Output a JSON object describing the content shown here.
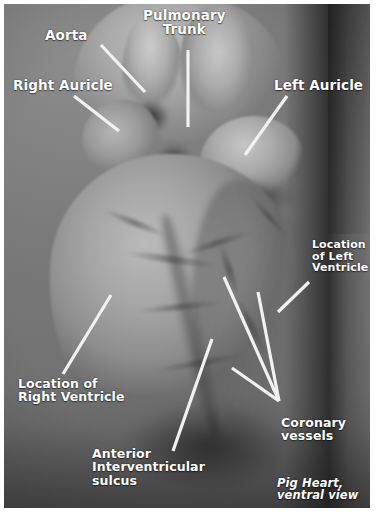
{
  "figure": {
    "subject": "Pig Heart, ventral view",
    "caption": "Pig Heart,\nventral view",
    "background_color": "#7e7e7e",
    "label_color": "#ffffff",
    "leader_line_color": "#f2f2f2",
    "frame_color": "#ffffff"
  },
  "labels": [
    {
      "id": "aorta",
      "text": "Aorta",
      "x": 45,
      "y": 28,
      "size": "lbl-lg",
      "align": "ta-left"
    },
    {
      "id": "pulmonary-trunk",
      "text": "Pulmonary\nTrunk",
      "x": 143,
      "y": 8,
      "size": "lbl-lg",
      "align": "ta-center"
    },
    {
      "id": "right-auricle",
      "text": "Right Auricle",
      "x": 13,
      "y": 78,
      "size": "lbl-lg",
      "align": "ta-left"
    },
    {
      "id": "left-auricle",
      "text": "Left Auricle",
      "x": 274,
      "y": 78,
      "size": "lbl-lg",
      "align": "ta-left"
    },
    {
      "id": "location-of-left-ventricle",
      "text": "Location\nof Left\nVentricle",
      "x": 312,
      "y": 239,
      "size": "lbl-sm",
      "align": "ta-left"
    },
    {
      "id": "location-of-right-ventricle",
      "text": "Location of\nRight Ventricle",
      "x": 18,
      "y": 377,
      "size": "lbl-md",
      "align": "ta-left"
    },
    {
      "id": "coronary-vessels",
      "text": "Coronary\nvessels",
      "x": 281,
      "y": 416,
      "size": "lbl-md",
      "align": "ta-left"
    },
    {
      "id": "anterior-interventricular-sulcus",
      "text": "Anterior\nInterventricular\nsulcus",
      "x": 92,
      "y": 447,
      "size": "lbl-md",
      "align": "ta-left"
    },
    {
      "id": "caption",
      "text": "Pig Heart,\nventral view",
      "x": 277,
      "y": 477,
      "size": "lbl-cap",
      "align": "ta-left"
    }
  ],
  "leader_lines": [
    {
      "id": "leader-aorta",
      "x1": 101,
      "y1": 45,
      "x2": 145,
      "y2": 92
    },
    {
      "id": "leader-pulmonary-trunk",
      "x1": 188,
      "y1": 50,
      "x2": 188,
      "y2": 127
    },
    {
      "id": "leader-right-auricle",
      "x1": 74,
      "y1": 96,
      "x2": 119,
      "y2": 131
    },
    {
      "id": "leader-left-auricle",
      "x1": 287,
      "y1": 96,
      "x2": 245,
      "y2": 155
    },
    {
      "id": "leader-left-ventricle",
      "x1": 309,
      "y1": 282,
      "x2": 278,
      "y2": 312
    },
    {
      "id": "leader-right-ventricle",
      "x1": 111,
      "y1": 295,
      "x2": 63,
      "y2": 374
    },
    {
      "id": "leader-sulcus",
      "x1": 212,
      "y1": 339,
      "x2": 173,
      "y2": 451
    },
    {
      "id": "leader-coronary-1",
      "x1": 224,
      "y1": 277,
      "x2": 279,
      "y2": 401
    },
    {
      "id": "leader-coronary-2",
      "x1": 258,
      "y1": 292,
      "x2": 279,
      "y2": 401
    },
    {
      "id": "leader-coronary-3",
      "x1": 232,
      "y1": 368,
      "x2": 279,
      "y2": 401
    }
  ],
  "vessel_streaks": [
    {
      "x": 196,
      "y": 262,
      "w": 58,
      "h": 7,
      "rot": 72
    },
    {
      "x": 214,
      "y": 318,
      "w": 66,
      "h": 6,
      "rot": 64
    },
    {
      "x": 176,
      "y": 236,
      "w": 74,
      "h": 6,
      "rot": -18
    },
    {
      "x": 120,
      "y": 252,
      "w": 96,
      "h": 7,
      "rot": 8
    },
    {
      "x": 132,
      "y": 300,
      "w": 88,
      "h": 6,
      "rot": -6
    },
    {
      "x": 238,
      "y": 210,
      "w": 54,
      "h": 5,
      "rot": 48
    },
    {
      "x": 96,
      "y": 216,
      "w": 70,
      "h": 6,
      "rot": 22
    },
    {
      "x": 150,
      "y": 356,
      "w": 92,
      "h": 6,
      "rot": -10
    }
  ]
}
